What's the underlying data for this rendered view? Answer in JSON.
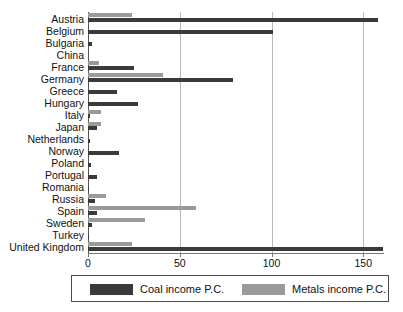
{
  "chart_data": {
    "type": "bar",
    "orientation": "horizontal",
    "title": "",
    "subtitle": "",
    "xlabel": "",
    "ylabel": "",
    "xlim": [
      0,
      161
    ],
    "xticks": [
      0,
      50,
      100,
      150
    ],
    "xtick_labels": [
      "0",
      "50",
      "100",
      "150"
    ],
    "grid": "vertical",
    "legend_position": "bottom",
    "categories": [
      "Austria",
      "Belgium",
      "Bulgaria",
      "China",
      "France",
      "Germany",
      "Greece",
      "Hungary",
      "Italy",
      "Japan",
      "Netherlands",
      "Norway",
      "Poland",
      "Portugal",
      "Romania",
      "Russia",
      "Spain",
      "Sweden",
      "Turkey",
      "United Kingdom"
    ],
    "series": [
      {
        "name": "Metals income P.C.",
        "color": "#9a9a9a",
        "values": [
          24,
          0,
          0,
          0,
          6,
          41,
          0,
          0,
          7,
          7,
          0,
          0,
          0,
          0,
          0,
          10,
          59,
          31,
          0,
          24
        ]
      },
      {
        "name": "Coal income P.C.",
        "color": "#3a3a3a",
        "values": [
          158,
          101,
          2,
          0,
          25,
          79,
          16,
          27,
          1,
          5,
          1,
          17,
          1.5,
          5,
          0.5,
          4,
          5,
          2,
          0.5,
          161
        ]
      }
    ]
  },
  "legend": {
    "items": [
      {
        "label": "Coal income P.C.",
        "color": "#3a3a3a"
      },
      {
        "label": "Metals income P.C.",
        "color": "#9a9a9a"
      }
    ]
  }
}
